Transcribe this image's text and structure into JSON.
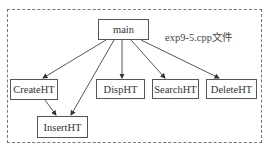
{
  "diagram": {
    "file_label": "exp9-5.cpp文件",
    "nodes": {
      "main": "main",
      "create": "CreateHT",
      "insert": "InsertHT",
      "disp": "DispHT",
      "search": "SearchHT",
      "delete": "DeleteHT"
    },
    "edges": [
      {
        "from": "main",
        "to": "CreateHT"
      },
      {
        "from": "main",
        "to": "InsertHT"
      },
      {
        "from": "main",
        "to": "DispHT"
      },
      {
        "from": "main",
        "to": "SearchHT"
      },
      {
        "from": "main",
        "to": "DeleteHT"
      },
      {
        "from": "CreateHT",
        "to": "InsertHT"
      }
    ]
  }
}
